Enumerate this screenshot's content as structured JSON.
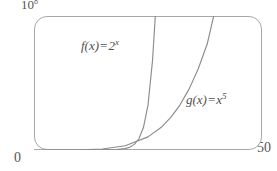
{
  "figure": {
    "part_label": ")",
    "axes": {
      "y_max_mantissa": "10",
      "y_max_exponent": "8",
      "x_min": "0",
      "x_max": "50"
    },
    "curves": [
      {
        "name": "f",
        "label_fn": "f(x)",
        "label_op": "=",
        "label_base": "2",
        "label_exponent": "x",
        "color": "#8c8c8c"
      },
      {
        "name": "g",
        "label_fn": "g(x)",
        "label_op": "=",
        "label_base": "x",
        "label_exponent": "5",
        "color": "#8c8c8c"
      }
    ]
  },
  "chart_data": {
    "type": "line",
    "title": "",
    "xlabel": "",
    "ylabel": "",
    "xlim": [
      0,
      50
    ],
    "ylim": [
      0,
      100000000
    ],
    "y_axis_tick_labels": [
      "0",
      "10^8"
    ],
    "x_axis_tick_labels": [
      "0",
      "50"
    ],
    "grid": false,
    "legend": "inline-annotations",
    "frame": "rounded-rectangle-viewport",
    "annotations": [
      {
        "text": "f(x) = 2^x",
        "x": 12,
        "y": 78000000
      },
      {
        "text": "g(x) = x^5",
        "x": 36,
        "y": 43000000
      }
    ],
    "series": [
      {
        "name": "f(x) = 2^x",
        "color": "#8c8c8c",
        "x": [
          0,
          5,
          10,
          14,
          16,
          18,
          20,
          21,
          22,
          23,
          24,
          25,
          26,
          26.6,
          27
        ],
        "values": [
          1,
          32,
          1024,
          16384,
          65536,
          262144,
          1048576,
          2097152,
          4194304,
          8388608,
          16777216,
          33554432,
          67108864,
          100000000,
          134217728
        ]
      },
      {
        "name": "g(x) = x^5",
        "color": "#8c8c8c",
        "x": [
          0,
          5,
          10,
          15,
          20,
          25,
          28,
          30,
          32,
          34,
          36,
          38,
          39.4,
          40
        ],
        "values": [
          0,
          3125,
          100000,
          759375,
          3200000,
          9765625,
          17210368,
          24300000,
          33554432,
          45435424,
          60466176,
          79235168,
          100000000,
          102400000
        ]
      }
    ]
  }
}
